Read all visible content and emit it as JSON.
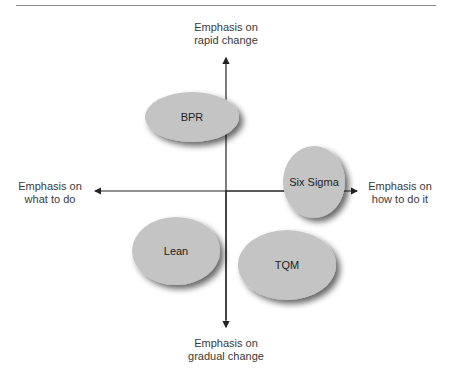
{
  "axes": {
    "top": {
      "line1": "Emphasis on",
      "line2": "rapid change"
    },
    "bottom": {
      "line1": "Emphasis on",
      "line2": "gradual change"
    },
    "left": {
      "line1": "Emphasis on",
      "line2": "what to do"
    },
    "right": {
      "line1": "Emphasis on",
      "line2": "how to do it"
    }
  },
  "nodes": [
    {
      "label": "BPR",
      "cx": 192,
      "cy": 117,
      "rx": 47,
      "ry": 25
    },
    {
      "label": "Six Sigma",
      "cx": 314,
      "cy": 182,
      "rx": 31,
      "ry": 36
    },
    {
      "label": "Lean",
      "cx": 176,
      "cy": 251,
      "rx": 44,
      "ry": 34
    },
    {
      "label": "TQM",
      "cx": 287,
      "cy": 265,
      "rx": 49,
      "ry": 35
    }
  ],
  "colors": {
    "node_fill": "#c4c4c4",
    "axis": "#222222",
    "rule": "#8a8a8a"
  }
}
